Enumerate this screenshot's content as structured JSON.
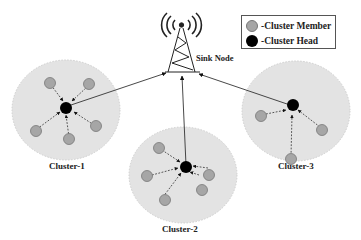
{
  "diagram": {
    "title": "",
    "sink": {
      "label": "Sink Node",
      "icon": "radio-tower-icon"
    },
    "legend": {
      "items": [
        {
          "label": "-Cluster Member",
          "color": "#a6a6a6",
          "shape": "circle"
        },
        {
          "label": "-Cluster Head",
          "color": "#000000",
          "shape": "circle"
        }
      ]
    },
    "clusters": [
      {
        "label": "Cluster-1",
        "members": 5,
        "head": "Cluster Head 1"
      },
      {
        "label": "Cluster-2",
        "members": 5,
        "head": "Cluster Head 2"
      },
      {
        "label": "Cluster-3",
        "members": 3,
        "head": "Cluster Head 3"
      }
    ],
    "edges": {
      "member_to_head": "dashed arrow",
      "head_to_sink": "solid arrow"
    },
    "colors": {
      "cluster_region": "#e3e3e3",
      "member_fill": "#a6a6a6",
      "head_fill": "#000000",
      "line": "#333333"
    }
  }
}
